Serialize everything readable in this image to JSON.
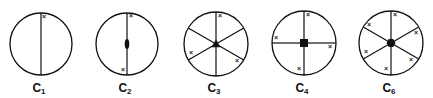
{
  "figure": {
    "diagrams": [
      {
        "id": "C1",
        "label_main": "C",
        "label_sub": "1",
        "cx": 41,
        "cy": 44,
        "r": 31,
        "spokes_deg": [
          90,
          270
        ],
        "center_marker": "none",
        "x_marks": [
          [
            44,
            17
          ]
        ]
      },
      {
        "id": "C2",
        "label_main": "C",
        "label_sub": "2",
        "cx": 127,
        "cy": 44,
        "r": 31,
        "spokes_deg": [
          90,
          270
        ],
        "center_marker": "ellipse",
        "x_marks": [
          [
            131,
            16
          ],
          [
            123,
            70
          ]
        ]
      },
      {
        "id": "C3",
        "label_main": "C",
        "label_sub": "3",
        "cx": 216,
        "cy": 44,
        "r": 32,
        "spokes_deg": [
          90,
          30,
          150,
          210,
          270,
          330
        ],
        "center_marker": "triangle",
        "x_marks": [
          [
            220,
            16
          ],
          [
            191,
            53
          ],
          [
            237,
            61
          ]
        ]
      },
      {
        "id": "C4",
        "label_main": "C",
        "label_sub": "4",
        "cx": 304,
        "cy": 43,
        "r": 32,
        "spokes_deg": [
          0,
          90,
          180,
          270
        ],
        "center_marker": "square",
        "x_marks": [
          [
            308,
            15
          ],
          [
            276,
            38
          ],
          [
            330,
            47
          ],
          [
            299,
            69
          ]
        ]
      },
      {
        "id": "C6",
        "label_main": "C",
        "label_sub": "6",
        "cx": 391,
        "cy": 43,
        "r": 32,
        "spokes_deg": [
          90,
          30,
          150,
          210,
          270,
          330
        ],
        "center_marker": "hexagon",
        "x_marks": [
          [
            395,
            15
          ],
          [
            369,
            25
          ],
          [
            416,
            33
          ],
          [
            366,
            52
          ],
          [
            411,
            60
          ],
          [
            386,
            69
          ]
        ]
      }
    ],
    "x_glyph": "×",
    "stroke_color": "#111111"
  }
}
